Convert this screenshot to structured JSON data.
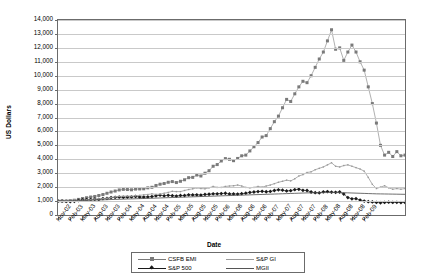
{
  "chart_data": {
    "type": "line",
    "title": "",
    "xlabel": "Date",
    "ylabel": "US Dollars",
    "ylim": [
      0,
      14000
    ],
    "ytick_labels": [
      "14,000",
      "13,000",
      "12,000",
      "11,000",
      "10,000",
      "9,000",
      "8,000",
      "7,000",
      "6,000",
      "5,000",
      "4,000",
      "3,000",
      "2,000",
      "1,000",
      "0"
    ],
    "ytick_values": [
      14000,
      13000,
      12000,
      11000,
      10000,
      9000,
      8000,
      7000,
      6000,
      5000,
      4000,
      3000,
      2000,
      1000,
      0
    ],
    "grid": true,
    "legend_position": "bottom",
    "xtick_labels": [
      "Nov-02",
      "Feb-03",
      "May-03",
      "Aug-03",
      "Nov-03",
      "Feb-04",
      "May-04",
      "Aug-04",
      "Nov-04",
      "Feb-05",
      "May-05",
      "Aug-05",
      "Nov-05",
      "Feb-06",
      "May-06",
      "Aug-06",
      "Nov-06",
      "Feb-07",
      "May-07",
      "Aug-07",
      "Nov-07",
      "Feb-08",
      "May-08",
      "Aug-08",
      "Nov-08",
      "Feb-09"
    ],
    "x_monthly": [
      "Nov-02",
      "Dec-02",
      "Jan-03",
      "Feb-03",
      "Mar-03",
      "Apr-03",
      "May-03",
      "Jun-03",
      "Jul-03",
      "Aug-03",
      "Sep-03",
      "Oct-03",
      "Nov-03",
      "Dec-03",
      "Jan-04",
      "Feb-04",
      "Mar-04",
      "Apr-04",
      "May-04",
      "Jun-04",
      "Jul-04",
      "Aug-04",
      "Sep-04",
      "Oct-04",
      "Nov-04",
      "Dec-04",
      "Jan-05",
      "Feb-05",
      "Mar-05",
      "Apr-05",
      "May-05",
      "Jun-05",
      "Jul-05",
      "Aug-05",
      "Sep-05",
      "Oct-05",
      "Nov-05",
      "Dec-05",
      "Jan-06",
      "Feb-06",
      "Mar-06",
      "Apr-06",
      "May-06",
      "Jun-06",
      "Jul-06",
      "Aug-06",
      "Sep-06",
      "Oct-06",
      "Nov-06",
      "Dec-06",
      "Jan-07",
      "Feb-07",
      "Mar-07",
      "Apr-07",
      "May-07",
      "Jun-07",
      "Jul-07",
      "Aug-07",
      "Sep-07",
      "Oct-07",
      "Nov-07",
      "Dec-07",
      "Jan-08",
      "Feb-08",
      "Mar-08",
      "Apr-08",
      "May-08",
      "Jun-08",
      "Jul-08",
      "Aug-08",
      "Sep-08",
      "Oct-08",
      "Nov-08",
      "Dec-08",
      "Jan-09",
      "Feb-09"
    ],
    "series": [
      {
        "name": "CSFB EMI",
        "marker": "square",
        "color": "#7a7a7a",
        "values": [
          1000,
          1010,
          1000,
          1030,
          1060,
          1120,
          1180,
          1240,
          1290,
          1330,
          1400,
          1470,
          1560,
          1650,
          1720,
          1800,
          1840,
          1830,
          1810,
          1860,
          1870,
          1880,
          1950,
          1990,
          2120,
          2210,
          2260,
          2350,
          2400,
          2330,
          2420,
          2530,
          2680,
          2700,
          2870,
          2800,
          3000,
          3180,
          3500,
          3620,
          3880,
          4050,
          4000,
          3900,
          4060,
          4250,
          4300,
          4600,
          4900,
          5200,
          5600,
          5700,
          6200,
          6700,
          7100,
          7700,
          8300,
          8150,
          8700,
          9200,
          9600,
          9500,
          10000,
          10600,
          11200,
          11700,
          12500,
          13300,
          11900,
          12000,
          11100,
          11700,
          12200,
          11700,
          11000,
          10400,
          9200,
          8000,
          6600,
          5000,
          4300,
          4500,
          4200,
          4550,
          4250,
          4300
        ]
      },
      {
        "name": "S&P 500",
        "marker": "diamond",
        "color": "#1a1a1a",
        "values": [
          1000,
          1000,
          980,
          970,
          980,
          1040,
          1080,
          1100,
          1110,
          1130,
          1120,
          1180,
          1190,
          1250,
          1270,
          1290,
          1270,
          1290,
          1300,
          1330,
          1290,
          1290,
          1300,
          1320,
          1380,
          1420,
          1380,
          1410,
          1390,
          1360,
          1400,
          1400,
          1450,
          1440,
          1450,
          1430,
          1480,
          1490,
          1520,
          1520,
          1540,
          1560,
          1510,
          1510,
          1500,
          1530,
          1570,
          1620,
          1650,
          1680,
          1700,
          1670,
          1690,
          1760,
          1810,
          1780,
          1730,
          1750,
          1820,
          1850,
          1770,
          1760,
          1650,
          1600,
          1590,
          1660,
          1680,
          1640,
          1630,
          1650,
          1500,
          1250,
          1160,
          1170,
          1070,
          1000,
          960,
          940,
          900,
          880,
          900,
          920,
          900,
          910,
          890,
          900
        ]
      },
      {
        "name": "S&P GI",
        "marker": "none",
        "color": "#9a9a9a",
        "values": [
          1000,
          1010,
          1040,
          1080,
          1080,
          1040,
          1060,
          1090,
          1100,
          1140,
          1160,
          1180,
          1200,
          1250,
          1300,
          1340,
          1350,
          1360,
          1350,
          1380,
          1410,
          1450,
          1470,
          1520,
          1480,
          1500,
          1560,
          1620,
          1700,
          1680,
          1680,
          1760,
          1830,
          1880,
          1950,
          1900,
          1880,
          1950,
          2050,
          1980,
          1980,
          2050,
          2080,
          2100,
          2150,
          2080,
          1980,
          1950,
          1980,
          2050,
          2000,
          2080,
          2150,
          2250,
          2350,
          2420,
          2500,
          2450,
          2600,
          2800,
          2900,
          3050,
          3100,
          3250,
          3350,
          3450,
          3600,
          3750,
          3500,
          3450,
          3550,
          3600,
          3500,
          3400,
          3300,
          3150,
          2700,
          2200,
          1900,
          2000,
          2100,
          1950,
          1850,
          1900,
          1850,
          1900
        ]
      },
      {
        "name": "MGII",
        "marker": "none",
        "color": "#555555",
        "values": [
          1000,
          1005,
          1010,
          1015,
          1020,
          1030,
          1040,
          1050,
          1060,
          1070,
          1080,
          1090,
          1100,
          1110,
          1120,
          1130,
          1140,
          1150,
          1155,
          1165,
          1175,
          1185,
          1195,
          1205,
          1215,
          1225,
          1235,
          1245,
          1255,
          1265,
          1275,
          1285,
          1295,
          1305,
          1315,
          1325,
          1335,
          1345,
          1355,
          1365,
          1375,
          1385,
          1395,
          1405,
          1415,
          1425,
          1435,
          1445,
          1455,
          1465,
          1475,
          1485,
          1495,
          1505,
          1515,
          1525,
          1535,
          1545,
          1555,
          1565,
          1575,
          1585,
          1590,
          1595,
          1600,
          1605,
          1610,
          1615,
          1610,
          1605,
          1600,
          1590,
          1580,
          1570,
          1560,
          1550,
          1540,
          1530,
          1520,
          1515,
          1510,
          1505,
          1500,
          1495,
          1490,
          1485
        ]
      }
    ]
  },
  "legend": {
    "items": [
      {
        "label": "CSFB EMI"
      },
      {
        "label": "S&P 500"
      },
      {
        "label": "S&P GI"
      },
      {
        "label": "MGII"
      }
    ]
  }
}
